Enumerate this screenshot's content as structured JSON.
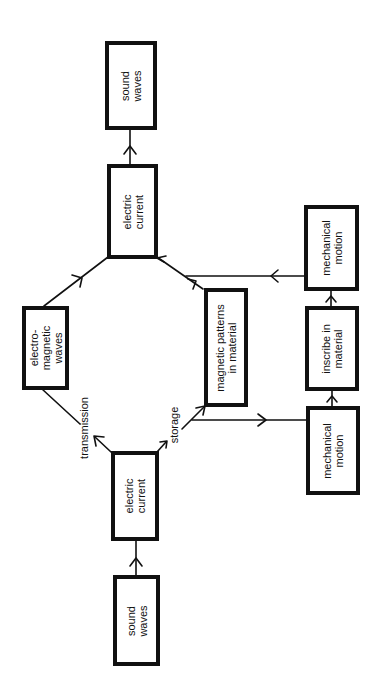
{
  "diagram": {
    "orientation": "rotated 90deg counter-clockwise (text reads bottom-to-top)",
    "nodes": {
      "sound_waves_in": {
        "label": "sound\nwaves"
      },
      "electric_current_in": {
        "label": "electric\ncurrent"
      },
      "electromagnetic_waves": {
        "label": "electro-\nmagnetic\nwaves"
      },
      "magnetic_patterns": {
        "label": "magnetic patterns\nin material"
      },
      "mechanical_motion_in": {
        "label": "mechanical\nmotion"
      },
      "inscribe_in_material": {
        "label": "inscribe in\nmaterial"
      },
      "mechanical_motion_out": {
        "label": "mechanical\nmotion"
      },
      "electric_current_out": {
        "label": "electric\ncurrent"
      },
      "sound_waves_out": {
        "label": "sound\nwaves"
      }
    },
    "edge_labels": {
      "transmission": "transmission",
      "storage": "storage"
    },
    "edges": [
      {
        "from": "sound_waves_in",
        "to": "electric_current_in"
      },
      {
        "from": "electric_current_in",
        "to": "electromagnetic_waves",
        "label": "transmission"
      },
      {
        "from": "electric_current_in",
        "to": "magnetic_patterns",
        "label": "storage"
      },
      {
        "from": "electric_current_in",
        "to": "mechanical_motion_in",
        "label": "storage"
      },
      {
        "from": "electromagnetic_waves",
        "to": "electric_current_out"
      },
      {
        "from": "magnetic_patterns",
        "to": "electric_current_out"
      },
      {
        "from": "mechanical_motion_in",
        "to": "inscribe_in_material"
      },
      {
        "from": "inscribe_in_material",
        "to": "mechanical_motion_out"
      },
      {
        "from": "mechanical_motion_out",
        "to": "electric_current_out"
      },
      {
        "from": "electric_current_out",
        "to": "sound_waves_out"
      }
    ],
    "colors": {
      "stroke": "#111111",
      "background": "#ffffff"
    }
  }
}
